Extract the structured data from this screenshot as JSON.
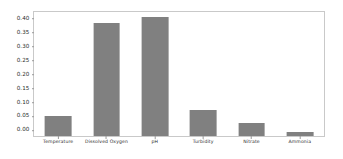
{
  "chart_data": {
    "type": "bar",
    "title": "",
    "subtitle": "",
    "xlabel": "",
    "ylabel": "",
    "categories": [
      "Temperature",
      "Dissolved Oxygen",
      "pH",
      "Turbidity",
      "Nitrate",
      "Ammonia"
    ],
    "values": [
      0.07,
      0.405,
      0.425,
      0.092,
      0.045,
      0.016
    ],
    "series": [
      {
        "name": "",
        "values": [
          0.07,
          0.405,
          0.425,
          0.092,
          0.045,
          0.016
        ]
      }
    ],
    "ylim": [
      0.0,
      0.4445
    ],
    "xlim": [
      -0.5,
      5.5
    ],
    "ytick_values": [
      0.0,
      0.05,
      0.1,
      0.15,
      0.2,
      0.25,
      0.3,
      0.35,
      0.4
    ],
    "ytick_labels": [
      "0.00",
      "0.05",
      "0.10",
      "0.15",
      "0.20",
      "0.25",
      "0.30",
      "0.35",
      "0.40"
    ],
    "grid": false,
    "legend": null,
    "legend_position": "none",
    "annotations": [],
    "bar_color": "#808080",
    "bar_width_fraction": 0.55,
    "background_color": "#ffffff",
    "spine_color": "#c9c9c9",
    "tick_color": "#9a9a9a",
    "tick_label_color": "#2b2b2b"
  }
}
